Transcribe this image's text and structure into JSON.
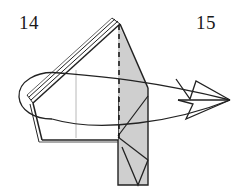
{
  "figure": {
    "kind": "origami-fold-diagram",
    "labels": {
      "left_step_number": "14",
      "right_step_number": "15"
    },
    "colors": {
      "background": "#ffffff",
      "ink": "#1a1a1a",
      "stroke": "#222222",
      "shaded_face": "#cfcfcf",
      "shaded_face_light": "#dddddd",
      "crease_line": "#8d8d8d",
      "dashed_fold": "#111111"
    },
    "elements": {
      "model_body": "folded-paper-model",
      "shaded_strip": "vertical-shaded-flap",
      "dashed_line": "valley-fold-dashed-line",
      "wrap_arrow": "wrap-around-curved-arrow",
      "arrow_head": "open-arrowhead-pointing-right",
      "layered_edges": "stacked-paper-layer-edges"
    },
    "geometry": {
      "strip_left": 118,
      "strip_right": 148,
      "strip_top": 24,
      "strip_bottom": 185,
      "dashed_x": 119,
      "arrow_tip_x": 230,
      "arrow_tip_y": 100,
      "loop_left_x": 18
    }
  }
}
